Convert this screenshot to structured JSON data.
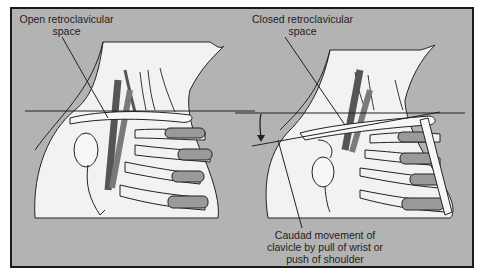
{
  "figure": {
    "labels": {
      "open_line1": "Open retroclavicular",
      "open_line2": "space",
      "closed_line1": "Closed retroclavicular",
      "closed_line2": "space",
      "caudad_line1": "Caudad movement of",
      "caudad_line2": "clavicle by pull of wrist or",
      "caudad_line3": "push of shoulder"
    },
    "panels": [
      {
        "name": "left",
        "state": "Open retroclavicular space"
      },
      {
        "name": "right",
        "state": "Closed retroclavicular space"
      }
    ],
    "colors": {
      "background": "#b3b3b3",
      "border": "#1a1a1a",
      "skin": "#f2f2f2",
      "vessel": "#7a7a7a",
      "cartilage": "#9a9a9a",
      "outline": "#222222"
    }
  }
}
